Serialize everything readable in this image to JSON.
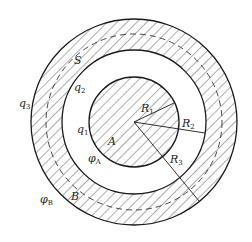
{
  "diagram": {
    "type": "concentric-sphere-conductor",
    "center": [
      134,
      122
    ],
    "radii_px": {
      "inner": 45,
      "shell_inner": 72,
      "shell_outer": 103,
      "gaussian": 88
    },
    "colors": {
      "stroke": "#1a1a1a",
      "hatch": "#333333",
      "background": "#ffffff"
    },
    "labels": {
      "S": {
        "base": "S",
        "sub": ""
      },
      "q3": {
        "base": "q",
        "sub": "3"
      },
      "q2": {
        "base": "q",
        "sub": "2"
      },
      "q1": {
        "base": "q",
        "sub": "1"
      },
      "R1": {
        "base": "R",
        "sub": "1"
      },
      "R2": {
        "base": "R",
        "sub": "2"
      },
      "R3": {
        "base": "R",
        "sub": "3"
      },
      "A": {
        "base": "A",
        "sub": ""
      },
      "phiA": {
        "base": "φ",
        "sub": "A"
      },
      "phiB": {
        "base": "φ",
        "sub": "B"
      },
      "B": {
        "base": "B",
        "sub": ""
      }
    }
  }
}
